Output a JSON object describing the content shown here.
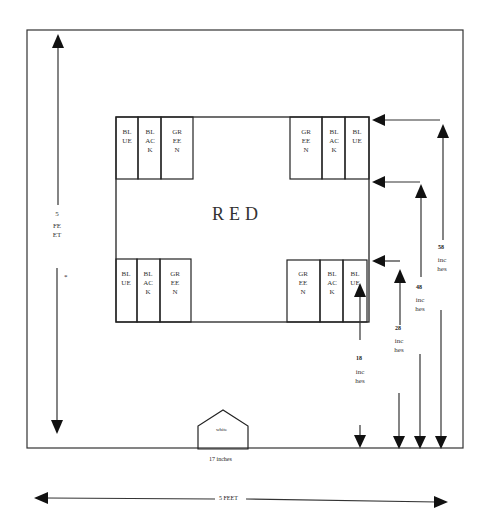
{
  "diagram": {
    "center_label": "RED",
    "home_plate_label": "white",
    "home_plate_width_label": "17 inches",
    "left_dimension": {
      "value": "5",
      "unit": "FEET",
      "note": "*"
    },
    "bottom_dimension": "5 FEET",
    "corner_groups": {
      "top_left": [
        "BLUE",
        "BLACK",
        "GREEN"
      ],
      "top_right": [
        "GREEN",
        "BLACK",
        "BLUE"
      ],
      "bottom_left": [
        "BLUE",
        "BLACK",
        "GREEN"
      ],
      "bottom_right": [
        "GREEN",
        "BLACK",
        "BLUE"
      ]
    },
    "right_dimensions": [
      {
        "value": "18",
        "unit": "inches"
      },
      {
        "value": "28",
        "unit": "inches"
      },
      {
        "value": "48",
        "unit": "inches"
      },
      {
        "value": "58",
        "unit": "inches"
      }
    ]
  }
}
